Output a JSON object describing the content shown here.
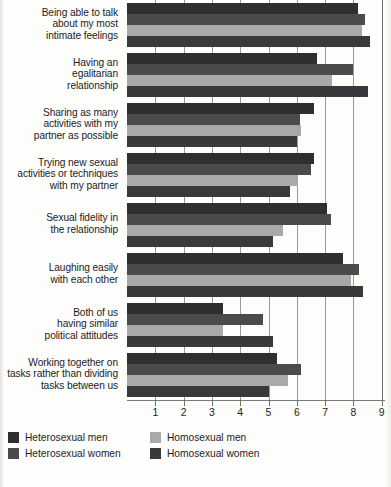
{
  "chart_data": {
    "type": "bar",
    "orientation": "horizontal",
    "title": "",
    "xlabel": "",
    "ylabel": "",
    "xlim": [
      0,
      9
    ],
    "grid": true,
    "legend_position": "bottom-left",
    "xticks": [
      1,
      2,
      3,
      4,
      5,
      6,
      7,
      8,
      9
    ],
    "categories": [
      "Being able to talk about my most intimate feelings",
      "Having an egalitarian relationship",
      "Sharing as many activities with my partner as possible",
      "Trying new sexual activities or techniques with my partner",
      "Sexual fidelity in the relationship",
      "Laughing easily with each other",
      "Both of us having similar political attitudes",
      "Working together on tasks rather than dividing tasks between us"
    ],
    "category_lines": [
      [
        "Being able to talk",
        "about my most",
        "intimate feelings"
      ],
      [
        "Having an",
        "egalitarian",
        "relationship"
      ],
      [
        "Sharing as many",
        "activities with my",
        "partner as possible"
      ],
      [
        "Trying new sexual",
        "activities or techniques",
        "with my partner"
      ],
      [
        "Sexual fidelity in",
        "the relationship"
      ],
      [
        "Laughing easily",
        "with each other"
      ],
      [
        "Both of us",
        "having similar",
        "political attitudes"
      ],
      [
        "Working together on",
        "tasks rather than dividing",
        "tasks between us"
      ]
    ],
    "series": [
      {
        "name": "Heterosexual men",
        "color": "#302f2f",
        "values": [
          8.15,
          6.7,
          6.6,
          6.6,
          7.05,
          7.65,
          3.4,
          5.3
        ]
      },
      {
        "name": "Heterosexual women",
        "color": "#4c4b4b",
        "values": [
          8.4,
          8.0,
          6.1,
          6.5,
          7.2,
          8.2,
          4.8,
          6.15
        ]
      },
      {
        "name": "Homosexual men",
        "color": "#a9a9a9",
        "values": [
          8.3,
          7.25,
          6.15,
          6.05,
          5.5,
          7.9,
          3.4,
          5.7
        ]
      },
      {
        "name": "Homosexual women",
        "color": "#39383a",
        "values": [
          8.6,
          8.5,
          6.0,
          5.75,
          5.15,
          8.35,
          5.15,
          5.0
        ]
      }
    ]
  },
  "legend": {
    "items": [
      {
        "label": "Heterosexual men",
        "color": "#302f2f"
      },
      {
        "label": "Heterosexual women",
        "color": "#4c4b4b"
      },
      {
        "label": "Homosexual men",
        "color": "#a9a9a9"
      },
      {
        "label": "Homosexual women",
        "color": "#39383a"
      }
    ]
  }
}
